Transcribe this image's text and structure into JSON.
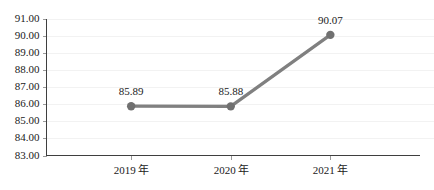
{
  "chart_data": {
    "type": "line",
    "title": "",
    "subtitle": "",
    "xlabel": "",
    "ylabel": "",
    "categories": [
      "2019 年",
      "2020 年",
      "2021 年"
    ],
    "values": [
      85.89,
      85.88,
      90.07
    ],
    "data_labels": [
      "85.89",
      "85.88",
      "90.07"
    ],
    "series": [
      {
        "name": "",
        "values": [
          85.89,
          85.88,
          90.07
        ],
        "color": "#808080",
        "marker": "circle",
        "marker_color": "#707070",
        "show_data_labels": true
      }
    ],
    "ylim": [
      83.0,
      91.0
    ],
    "ytick_step": 1.0,
    "ytick_labels": [
      "91.00",
      "90.00",
      "89.00",
      "88.00",
      "87.00",
      "86.00",
      "85.00",
      "84.00",
      "83.00"
    ],
    "ytick_values": [
      91.0,
      90.0,
      89.0,
      88.0,
      87.0,
      86.0,
      85.0,
      84.0,
      83.0
    ],
    "xtick_labels": [
      "2019 年",
      "2020 年",
      "2021 年"
    ],
    "grid": true,
    "grid_axis": "y",
    "grid_color": "#f2f2f2",
    "legend": false,
    "legend_position": "none",
    "axis_color": "#3f3f3f",
    "background_color": "#ffffff",
    "text_color": "#1a1a1a"
  }
}
